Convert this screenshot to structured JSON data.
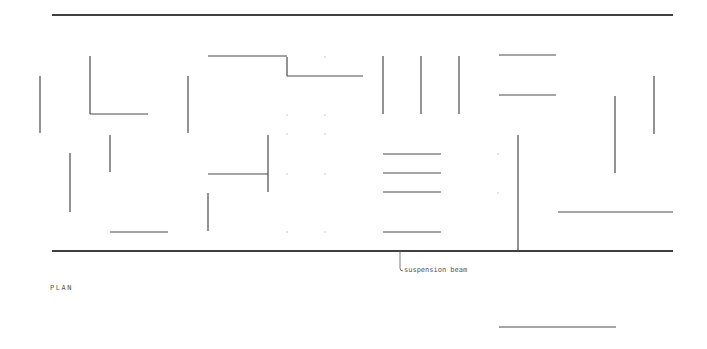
{
  "diagram": {
    "type": "architectural-plan",
    "colors": {
      "background": "#ffffff",
      "line": "#4a4a4a",
      "beam": "#404040",
      "text": "#555555",
      "faint": "#cccccc"
    },
    "labels": {
      "plan_title": "PLAN",
      "beam_annotation": "suspension beam"
    },
    "beams": [
      {
        "name": "top-beam",
        "x1": 52,
        "y1": 15,
        "x2": 673,
        "y2": 15
      },
      {
        "name": "suspension-beam",
        "x1": 52,
        "y1": 251,
        "x2": 673,
        "y2": 251
      }
    ],
    "walls": [
      {
        "name": "wall-v-left",
        "x1": 40,
        "y1": 76,
        "x2": 40,
        "y2": 133
      },
      {
        "name": "wall-l-vertical",
        "x1": 90,
        "y1": 56,
        "x2": 90,
        "y2": 114
      },
      {
        "name": "wall-l-horizontal",
        "x1": 90,
        "y1": 114,
        "x2": 148,
        "y2": 114
      },
      {
        "name": "wall-v-188",
        "x1": 188,
        "y1": 76,
        "x2": 188,
        "y2": 133
      },
      {
        "name": "wall-step-top",
        "x1": 208,
        "y1": 56,
        "x2": 287,
        "y2": 56
      },
      {
        "name": "wall-step-riser",
        "x1": 287,
        "y1": 57,
        "x2": 287,
        "y2": 76
      },
      {
        "name": "wall-step-bottom",
        "x1": 287,
        "y1": 76,
        "x2": 363,
        "y2": 76
      },
      {
        "name": "wall-v-383",
        "x1": 383,
        "y1": 56,
        "x2": 383,
        "y2": 114
      },
      {
        "name": "wall-v-421",
        "x1": 421,
        "y1": 56,
        "x2": 421,
        "y2": 114
      },
      {
        "name": "wall-v-459",
        "x1": 459,
        "y1": 56,
        "x2": 459,
        "y2": 114
      },
      {
        "name": "wall-h-55",
        "x1": 499,
        "y1": 55,
        "x2": 556,
        "y2": 55
      },
      {
        "name": "wall-h-95",
        "x1": 499,
        "y1": 95,
        "x2": 556,
        "y2": 95
      },
      {
        "name": "wall-v-110",
        "x1": 110,
        "y1": 135,
        "x2": 110,
        "y2": 172
      },
      {
        "name": "wall-v-70",
        "x1": 70,
        "y1": 153,
        "x2": 70,
        "y2": 212
      },
      {
        "name": "wall-h-232-left",
        "x1": 110,
        "y1": 232,
        "x2": 168,
        "y2": 232
      },
      {
        "name": "wall-t-horizontal",
        "x1": 208,
        "y1": 174,
        "x2": 268,
        "y2": 174
      },
      {
        "name": "wall-t-vertical",
        "x1": 268,
        "y1": 135,
        "x2": 268,
        "y2": 192
      },
      {
        "name": "wall-v-208",
        "x1": 208,
        "y1": 193,
        "x2": 208,
        "y2": 231
      },
      {
        "name": "wall-h-154",
        "x1": 383,
        "y1": 154,
        "x2": 441,
        "y2": 154
      },
      {
        "name": "wall-h-173",
        "x1": 383,
        "y1": 173,
        "x2": 441,
        "y2": 173
      },
      {
        "name": "wall-h-192",
        "x1": 383,
        "y1": 192,
        "x2": 441,
        "y2": 192
      },
      {
        "name": "wall-h-232-mid",
        "x1": 383,
        "y1": 232,
        "x2": 441,
        "y2": 232
      },
      {
        "name": "wall-v-518",
        "x1": 518,
        "y1": 135,
        "x2": 518,
        "y2": 251
      },
      {
        "name": "wall-v-615",
        "x1": 615,
        "y1": 96,
        "x2": 615,
        "y2": 173
      },
      {
        "name": "wall-v-654",
        "x1": 654,
        "y1": 76,
        "x2": 654,
        "y2": 134
      },
      {
        "name": "wall-h-212",
        "x1": 558,
        "y1": 212,
        "x2": 673,
        "y2": 212
      },
      {
        "name": "wall-h-327",
        "x1": 499,
        "y1": 327,
        "x2": 616,
        "y2": 327
      }
    ],
    "grid_marks": [
      {
        "x": 287,
        "y": 134
      },
      {
        "x": 325,
        "y": 134
      },
      {
        "x": 287,
        "y": 174
      },
      {
        "x": 325,
        "y": 174
      },
      {
        "x": 287,
        "y": 232
      },
      {
        "x": 325,
        "y": 232
      },
      {
        "x": 325,
        "y": 57
      },
      {
        "x": 287,
        "y": 115
      },
      {
        "x": 325,
        "y": 115
      },
      {
        "x": 498,
        "y": 154
      },
      {
        "x": 498,
        "y": 193
      }
    ]
  }
}
